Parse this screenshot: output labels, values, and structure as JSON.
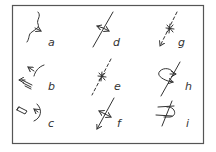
{
  "diagram": {
    "title": "",
    "border_color": "#555555",
    "ink_color": "#333333",
    "panels": [
      {
        "id": "a",
        "label": "a",
        "symbol": "wavy-line-with-arrow"
      },
      {
        "id": "b",
        "label": "b",
        "symbol": "branch-arrow-with-pencil"
      },
      {
        "id": "c",
        "label": "c",
        "symbol": "pencil-with-arc-arrow"
      },
      {
        "id": "d",
        "label": "d",
        "symbol": "line-with-double-arrow-crossing"
      },
      {
        "id": "e",
        "label": "e",
        "symbol": "dashed-line-with-star"
      },
      {
        "id": "f",
        "label": "f",
        "symbol": "arrow-line-with-double-arrow-crossing"
      },
      {
        "id": "g",
        "label": "g",
        "symbol": "dashed-arrow-with-star"
      },
      {
        "id": "h",
        "label": "h",
        "symbol": "line-with-loop-arrow"
      },
      {
        "id": "i",
        "label": "i",
        "symbol": "line-with-loop-and-crossings"
      }
    ]
  }
}
